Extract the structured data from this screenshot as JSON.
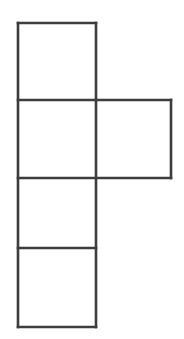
{
  "figure": {
    "name": "cube-net-hexomino",
    "background_color": "#FFFFFF",
    "line_color": "#3D3D3D",
    "line_width": 2.6,
    "fill_color": "#FFFFFF",
    "canvas": {
      "width": 184,
      "height": 339
    },
    "grid": {
      "column_x": [
        18,
        96,
        171
      ],
      "row_y": [
        23,
        100,
        178,
        248,
        327
      ]
    },
    "squares": [
      {
        "id": "square-top",
        "label": "",
        "x": 18,
        "y": 23,
        "width": 78,
        "height": 77
      },
      {
        "id": "square-second-left",
        "label": "",
        "x": 18,
        "y": 100,
        "width": 78,
        "height": 78
      },
      {
        "id": "square-second-right",
        "label": "",
        "x": 96,
        "y": 100,
        "width": 75,
        "height": 78
      },
      {
        "id": "square-third",
        "label": "",
        "x": 18,
        "y": 178,
        "width": 78,
        "height": 70
      },
      {
        "id": "square-bottom",
        "label": "",
        "x": 18,
        "y": 248,
        "width": 78,
        "height": 79
      }
    ],
    "edges": [
      {
        "id": "edge-top",
        "x1": 18,
        "y1": 23,
        "x2": 96,
        "y2": 23
      },
      {
        "id": "edge-left-column",
        "x1": 18,
        "y1": 23,
        "x2": 18,
        "y2": 327
      },
      {
        "id": "edge-right-column-upper",
        "x1": 96,
        "y1": 23,
        "x2": 96,
        "y2": 100
      },
      {
        "id": "edge-divider-1",
        "x1": 18,
        "y1": 100,
        "x2": 171,
        "y2": 100
      },
      {
        "id": "edge-right-column-mid",
        "x1": 96,
        "y1": 100,
        "x2": 96,
        "y2": 327
      },
      {
        "id": "edge-right-square-right",
        "x1": 171,
        "y1": 100,
        "x2": 171,
        "y2": 178
      },
      {
        "id": "edge-divider-2",
        "x1": 18,
        "y1": 178,
        "x2": 171,
        "y2": 178
      },
      {
        "id": "edge-divider-3",
        "x1": 18,
        "y1": 248,
        "x2": 96,
        "y2": 248
      },
      {
        "id": "edge-bottom",
        "x1": 18,
        "y1": 327,
        "x2": 96,
        "y2": 327
      }
    ]
  }
}
